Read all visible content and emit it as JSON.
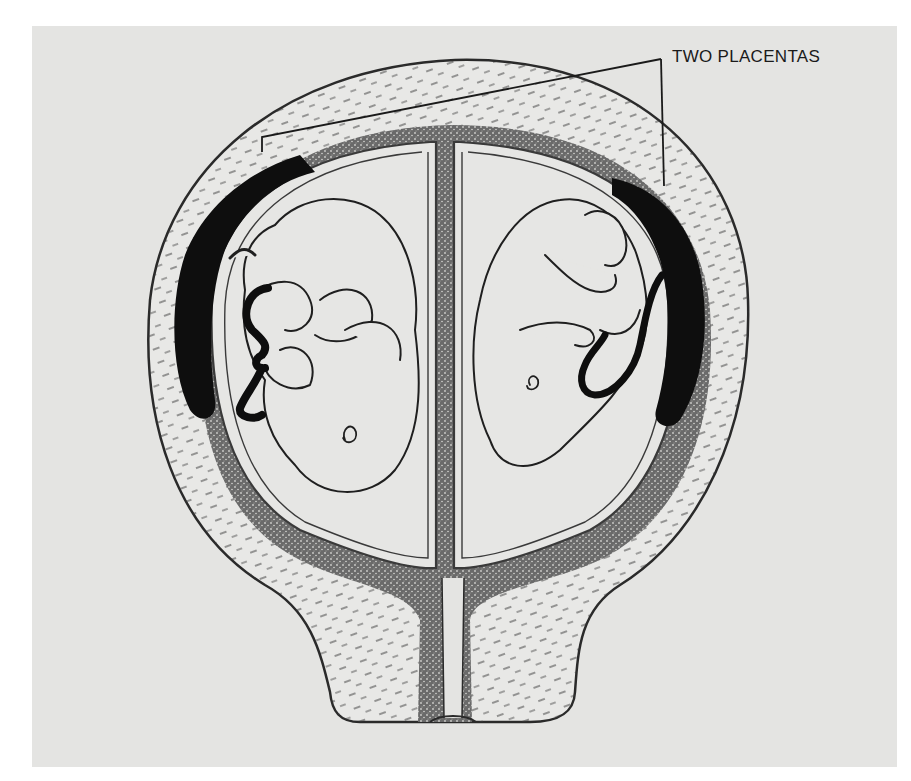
{
  "figure": {
    "labels": [
      {
        "id": "two-placentas",
        "text": "TWO PLACENTAS"
      }
    ]
  },
  "colors": {
    "background": "#e4e4e2",
    "ink": "#1a1a1a",
    "stipple": "#4a4a4a"
  }
}
